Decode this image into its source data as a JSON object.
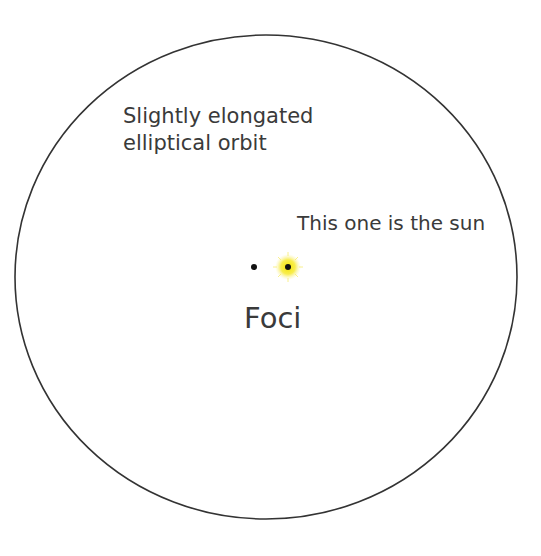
{
  "diagram": {
    "type": "orbit-ellipse",
    "labels": {
      "orbit_line1": "Slightly elongated",
      "orbit_line2": "elliptical orbit",
      "sun": "This one is the sun",
      "foci": "Foci"
    },
    "ellipse": {
      "cx": 266,
      "cy": 277,
      "rx": 251,
      "ry": 242,
      "stroke": "#333333"
    },
    "foci": [
      {
        "name": "empty-focus",
        "x": 254,
        "y": 267
      },
      {
        "name": "sun-focus",
        "x": 288,
        "y": 267,
        "glow": "#f5e400"
      }
    ]
  }
}
